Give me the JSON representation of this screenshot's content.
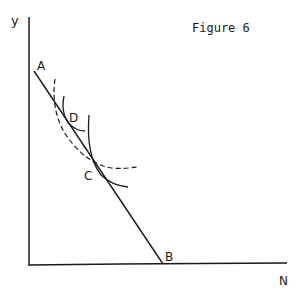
{
  "title": "Figure 6",
  "axes": {
    "y_label": "y",
    "x_label": "N"
  },
  "points": {
    "A": "A",
    "B": "B",
    "C": "C",
    "D": "D"
  },
  "colors": {
    "ink": "#1a1a1a",
    "background": "#ffffff"
  }
}
